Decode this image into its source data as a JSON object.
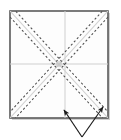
{
  "figure": {
    "canvas": {
      "width": 121,
      "height": 140
    },
    "background_color": "#ffffff"
  },
  "paper": {
    "shape": "square",
    "label": "paper-square",
    "x": 10,
    "y": 11,
    "width": 98,
    "height": 107,
    "fill_color": "#fdfdfd",
    "border_color": "#5a5a5a",
    "border_width": 1.6,
    "shadow_color": "#9a9a9a"
  },
  "creases": {
    "center_lines": {
      "label": "center-creases",
      "color": "#cfcfcf",
      "width": 1,
      "horizontal_y": 64,
      "vertical_x": 65
    },
    "diagonal_guides": {
      "label": "diagonal-guides",
      "color": "#d2d2d2",
      "width": 1.1
    },
    "pleat_pairs": {
      "label": "pleat-dashed-pairs",
      "color": "#4d4d4d",
      "width": 1.05,
      "dash_pattern": "2.2 2.2",
      "offset": 4.0,
      "count": 4,
      "style": "dashed"
    }
  },
  "arrows": {
    "color": "#1c1c1c",
    "width": 1.2,
    "vertex": {
      "x": 82,
      "y": 137
    },
    "items": [
      {
        "label": "fold-arrow-left",
        "direction": "up-left",
        "tip_x": 64,
        "tip_y": 110,
        "head_angle_deg": 235
      },
      {
        "label": "fold-arrow-right",
        "direction": "up-right",
        "tip_x": 103,
        "tip_y": 107,
        "head_angle_deg": 305
      }
    ]
  },
  "center_point": {
    "label": "center-intersection",
    "x": 59,
    "y": 64,
    "radius": 3.2,
    "color": "#bdbdbd"
  }
}
